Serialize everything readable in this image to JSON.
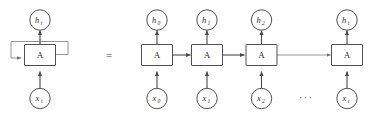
{
  "figure": {
    "equals_sign": "=",
    "ellipsis": "···",
    "colors": {
      "background": "#ffffff",
      "stroke": "#3c3c3c",
      "wire": "#4a4a4a",
      "wire_faint": "#8a8a8a",
      "text": "#2b2b2b"
    },
    "cell_label": "A",
    "rolled": {
      "output": {
        "base": "h",
        "sub": "t"
      },
      "input": {
        "base": "x",
        "sub": "t"
      },
      "cell": "A"
    },
    "unrolled": {
      "steps": [
        {
          "output": {
            "base": "h",
            "sub": "0"
          },
          "cell": "A",
          "input": {
            "base": "x",
            "sub": "0"
          }
        },
        {
          "output": {
            "base": "h",
            "sub": "1"
          },
          "cell": "A",
          "input": {
            "base": "x",
            "sub": "1"
          }
        },
        {
          "output": {
            "base": "h",
            "sub": "2"
          },
          "cell": "A",
          "input": {
            "base": "x",
            "sub": "2"
          }
        },
        {
          "output": {
            "base": "h",
            "sub": "t"
          },
          "cell": "A",
          "input": {
            "base": "x",
            "sub": "t"
          }
        }
      ]
    }
  }
}
